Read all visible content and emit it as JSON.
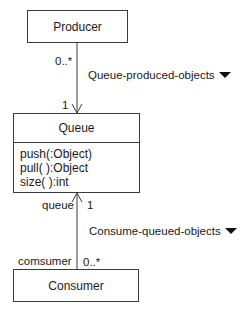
{
  "diagram": {
    "type": "UML class diagram",
    "classes": {
      "producer": {
        "name": "Producer"
      },
      "queue": {
        "name": "Queue",
        "operations": [
          "push(:Object)",
          "pull( ):Object",
          "size( ):int"
        ]
      },
      "consumer": {
        "name": "Consumer"
      }
    },
    "associations": {
      "produced": {
        "name": "Queue-produced-objects",
        "direction_icon": "triangle-down-icon",
        "producer_multiplicity": "0..*",
        "queue_multiplicity": "1"
      },
      "consumed": {
        "name": "Consume-queued-objects",
        "direction_icon": "triangle-down-icon",
        "queue_role": "queue",
        "queue_multiplicity": "1",
        "consumer_role": "comsumer",
        "consumer_multiplicity": "0..*"
      }
    },
    "colors": {
      "line": "#3a3a3a",
      "text": "#1a1a1a",
      "background": "#ffffff"
    }
  }
}
